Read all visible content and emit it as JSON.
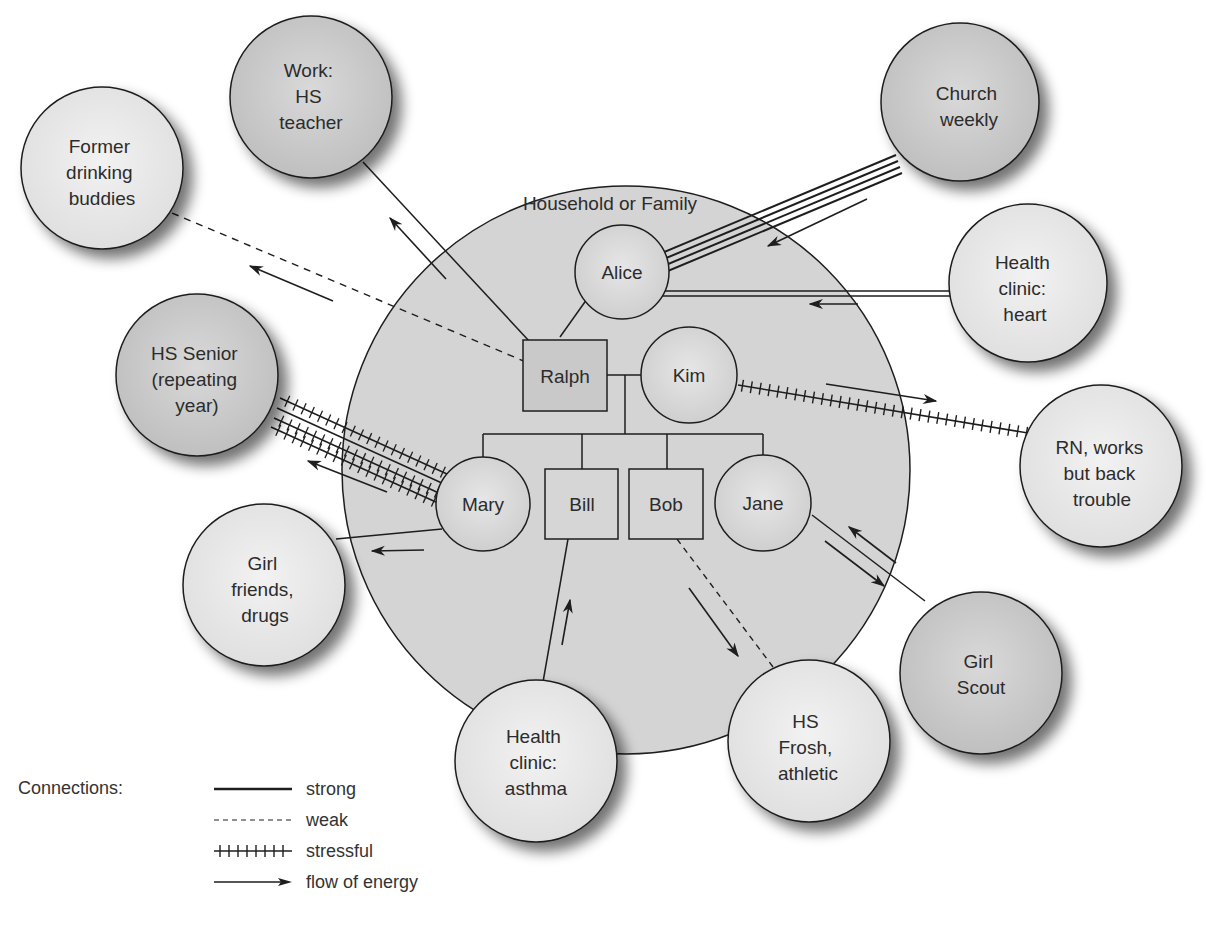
{
  "household": {
    "label": "Household or Family",
    "members": [
      {
        "id": "alice",
        "label": "Alice",
        "shape": "circle"
      },
      {
        "id": "ralph",
        "label": "Ralph",
        "shape": "square"
      },
      {
        "id": "kim",
        "label": "Kim",
        "shape": "circle"
      },
      {
        "id": "mary",
        "label": "Mary",
        "shape": "circle"
      },
      {
        "id": "bill",
        "label": "Bill",
        "shape": "square"
      },
      {
        "id": "bob",
        "label": "Bob",
        "shape": "square"
      },
      {
        "id": "jane",
        "label": "Jane",
        "shape": "circle"
      }
    ]
  },
  "external_systems": [
    {
      "id": "work",
      "lines": [
        "Work:",
        "HS",
        "teacher"
      ]
    },
    {
      "id": "drinking",
      "lines": [
        "Former",
        "drinking",
        "buddies"
      ]
    },
    {
      "id": "church",
      "lines": [
        "Church",
        "weekly"
      ]
    },
    {
      "id": "heart",
      "lines": [
        "Health",
        "clinic:",
        "heart"
      ]
    },
    {
      "id": "senior",
      "lines": [
        "HS Senior",
        "(repeating",
        "year)"
      ]
    },
    {
      "id": "rn",
      "lines": [
        "RN, works",
        "but back",
        "trouble"
      ]
    },
    {
      "id": "girlfriends",
      "lines": [
        "Girl",
        "friends,",
        "drugs"
      ]
    },
    {
      "id": "scout",
      "lines": [
        "Girl",
        "Scout"
      ]
    },
    {
      "id": "asthma",
      "lines": [
        "Health",
        "clinic:",
        "asthma"
      ]
    },
    {
      "id": "frosh",
      "lines": [
        "HS",
        "Frosh,",
        "athletic"
      ]
    }
  ],
  "connections": [
    {
      "from": "ralph",
      "to": "work",
      "type": "strong",
      "energy": "to external"
    },
    {
      "from": "ralph",
      "to": "drinking",
      "type": "weak",
      "energy": "to external"
    },
    {
      "from": "alice",
      "to": "church",
      "type": "very strong (4 lines)",
      "energy": "to family member"
    },
    {
      "from": "alice",
      "to": "heart",
      "type": "strong (double line)",
      "energy": "to family member"
    },
    {
      "from": "kim",
      "to": "rn",
      "type": "stressful",
      "energy": "to external"
    },
    {
      "from": "mary",
      "to": "senior",
      "type": "stressful (multiple)",
      "energy": "to external"
    },
    {
      "from": "mary",
      "to": "girlfriends",
      "type": "strong",
      "energy": "to external"
    },
    {
      "from": "bill",
      "to": "asthma",
      "type": "strong",
      "energy": "to family member"
    },
    {
      "from": "bob",
      "to": "frosh",
      "type": "weak",
      "energy": "to external"
    },
    {
      "from": "jane",
      "to": "scout",
      "type": "strong",
      "energy": "both directions"
    }
  ],
  "legend": {
    "title": "Connections:",
    "items": [
      {
        "style": "strong",
        "label": "strong"
      },
      {
        "style": "weak",
        "label": "weak"
      },
      {
        "style": "stressful",
        "label": "stressful"
      },
      {
        "style": "arrow",
        "label": "flow of energy"
      }
    ]
  },
  "colors": {
    "household_fill": "#d2d2d2",
    "member_fill": "#d9d9d9",
    "external_light": "#e8e8e8",
    "external_dark": "#c4c4c4",
    "stroke": "#1e1e1e",
    "shadow": "#9a9a9a"
  }
}
